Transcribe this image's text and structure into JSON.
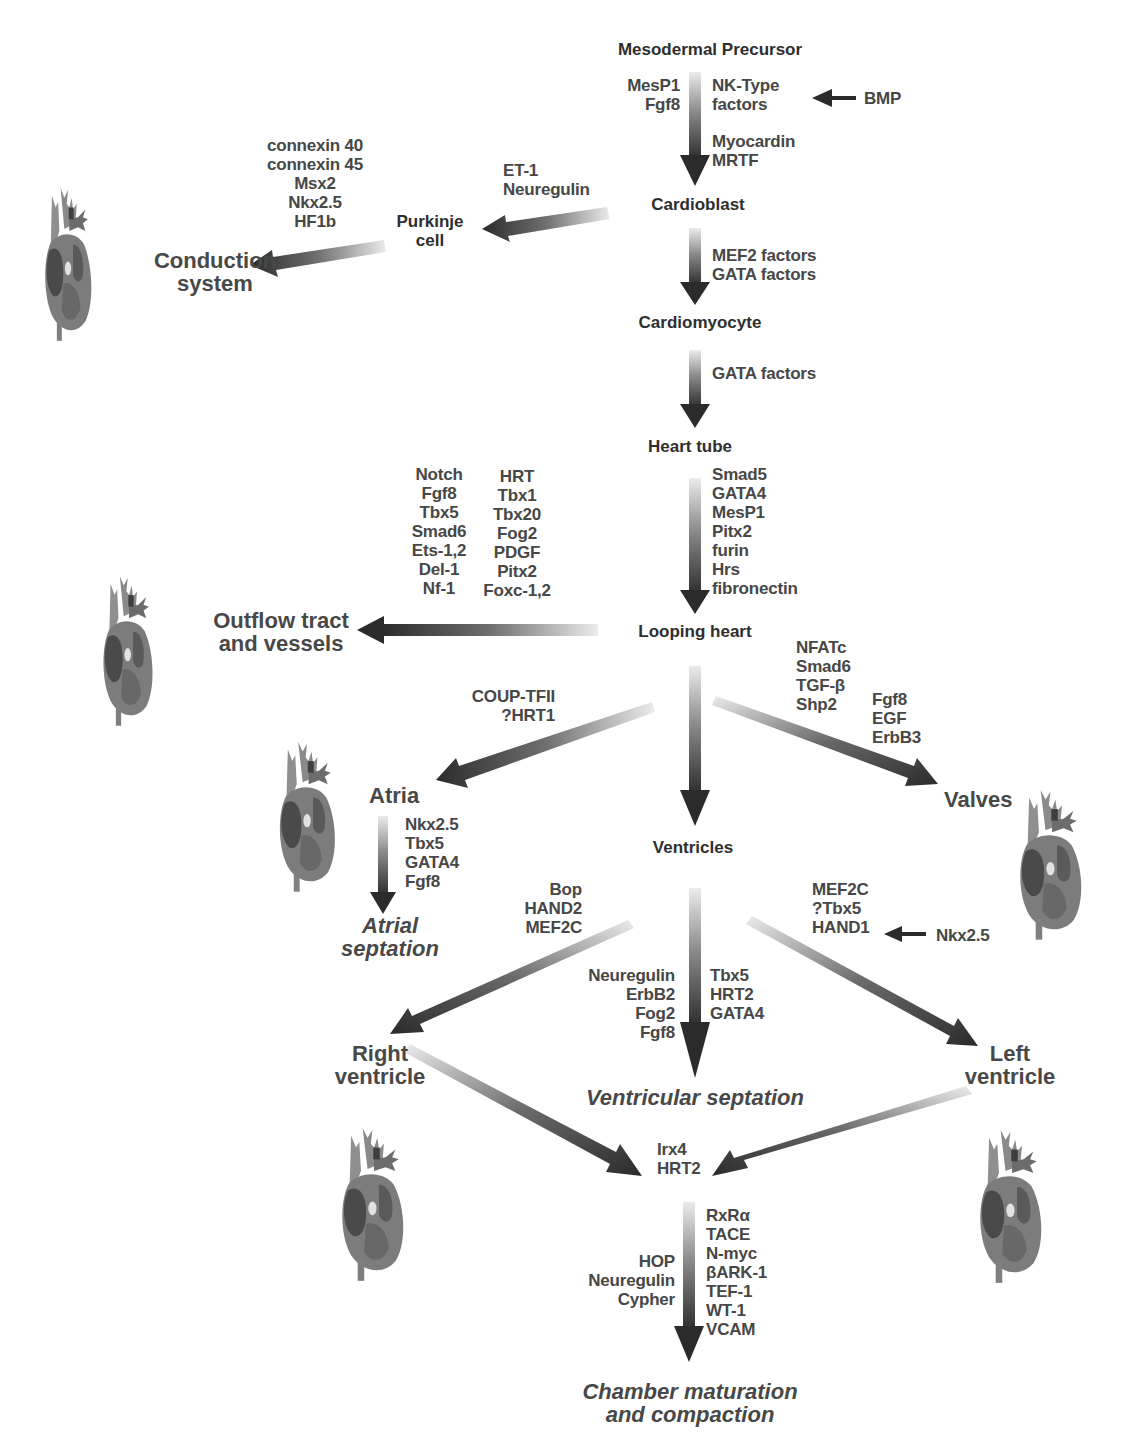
{
  "stages": {
    "mesodermal_precursor": "Mesodermal Precursor",
    "cardioblast": "Cardioblast",
    "cardiomyocyte": "Cardiomyocyte",
    "heart_tube": "Heart tube",
    "looping_heart": "Looping heart",
    "ventricles": "Ventricles",
    "purkinje_cell": "Purkinje\ncell"
  },
  "outcomes": {
    "conduction_system": "Conduction\nsystem",
    "outflow_tract": "Outflow tract\nand vessels",
    "atria": "Atria",
    "valves": "Valves",
    "atrial_septation": "Atrial\nseptation",
    "right_ventricle": "Right\nventricle",
    "left_ventricle": "Left\nventricle",
    "ventricular_septation": "Ventricular septation",
    "chamber_maturation": "Chamber maturation\nand compaction"
  },
  "factors": {
    "precursor_left": "MesP1\nFgf8",
    "precursor_right_nk": "NK-Type\nfactors",
    "precursor_right_myo": "Myocardin\nMRTF",
    "bmp": "BMP",
    "purkinje_inducers": "ET-1\nNeuregulin",
    "conduction_factors": "connexin 40\nconnexin 45\nMsx2\nNkx2.5\nHF1b",
    "cardioblast_to_myocyte": "MEF2 factors\nGATA factors",
    "myocyte_to_tube": "GATA factors",
    "tube_to_looping": "Smad5\nGATA4\nMesP1\nPitx2\nfurin\nHrs\nfibronectin",
    "outflow_col1": "Notch\nFgf8\nTbx5\nSmad6\nEts-1,2\nDel-1\nNf-1",
    "outflow_col2": "HRT\nTbx1\nTbx20\nFog2\nPDGF\nPitx2\nFoxc-1,2",
    "atria_inducers": "COUP-TFII\n?HRT1",
    "valves_col1": "NFATc\nSmad6\nTGF-β\nShp2",
    "valves_col2": "Fgf8\nEGF\nErbB3",
    "atrial_septation_factors": "Nkx2.5\nTbx5\nGATA4\nFgf8",
    "right_ventricle_factors": "Bop\nHAND2\nMEF2C",
    "left_ventricle_factors": "MEF2C\n?Tbx5\nHAND1",
    "nkx25_input": "Nkx2.5",
    "septation_left": "Neuregulin\nErbB2\nFog2\nFgf8",
    "septation_right": "Tbx5\nHRT2\nGATA4",
    "chamber_convergence": "Irx4\nHRT2",
    "maturation_left": "HOP\nNeuregulin\nCypher",
    "maturation_right": "RxRα\nTACE\nN-myc\nβARK-1\nTEF-1\nWT-1\nVCAM"
  },
  "colors": {
    "arrow_dark": "#2b2b2b",
    "arrow_light": "#e4e4e4",
    "text": "#474747",
    "heart_body": "#7a7a7a",
    "heart_dark": "#555555",
    "heart_light": "#9c9c9c"
  }
}
